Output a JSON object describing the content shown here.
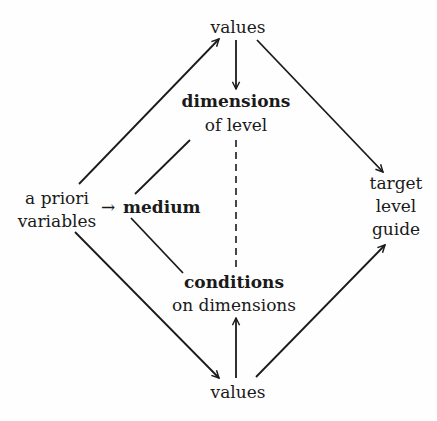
{
  "nodes": {
    "values_top": {
      "label": "values"
    },
    "dimensions": {
      "line1": "dimensions",
      "line2": "of level"
    },
    "a_priori": {
      "line1": "a priori",
      "line2": "variables"
    },
    "medium": {
      "label": "medium",
      "prefix_arrow": "→"
    },
    "conditions": {
      "line1": "conditions",
      "line2": "on dimensions"
    },
    "values_bottom": {
      "label": "values"
    },
    "target": {
      "line1": "target",
      "line2": "level",
      "line3": "guide"
    }
  },
  "edges": [
    {
      "from": "a priori variables",
      "to": "values (top)",
      "style": "arrow"
    },
    {
      "from": "values (top)",
      "to": "dimensions of level",
      "style": "arrow"
    },
    {
      "from": "values (top)",
      "to": "target level guide",
      "style": "arrow"
    },
    {
      "from": "a priori variables",
      "to": "medium",
      "style": "arrow"
    },
    {
      "from": "medium",
      "to": "dimensions of level",
      "style": "line"
    },
    {
      "from": "medium",
      "to": "conditions on dimensions",
      "style": "line"
    },
    {
      "from": "dimensions of level",
      "to": "conditions on dimensions",
      "style": "dashed"
    },
    {
      "from": "a priori variables",
      "to": "values (bottom)",
      "style": "arrow"
    },
    {
      "from": "values (bottom)",
      "to": "conditions on dimensions",
      "style": "arrow"
    },
    {
      "from": "values (bottom)",
      "to": "target level guide",
      "style": "arrow"
    }
  ]
}
